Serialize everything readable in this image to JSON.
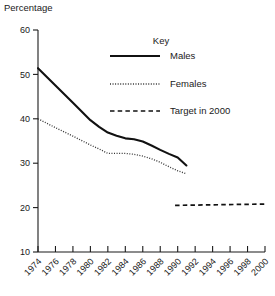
{
  "chart_data": {
    "type": "line",
    "title": "",
    "subtitle": "",
    "xlabel": "",
    "ylabel": "Percentage",
    "xlim": [
      1974,
      2000
    ],
    "ylim": [
      10,
      60
    ],
    "grid": false,
    "legend_position": "top-right",
    "legend_title": "Key",
    "x_ticks": [
      1974,
      1976,
      1978,
      1980,
      1982,
      1984,
      1986,
      1988,
      1990,
      1992,
      1994,
      1996,
      1998,
      2000
    ],
    "x_tick_labels": [
      "1974",
      "1976",
      "1978",
      "1980",
      "1982",
      "1984",
      "1986",
      "1988",
      "1990",
      "1992",
      "1994",
      "1996",
      "1998",
      "2000"
    ],
    "y_ticks": [
      10,
      20,
      30,
      40,
      50,
      60
    ],
    "y_tick_labels": [
      "10",
      "20",
      "30",
      "40",
      "50",
      "60"
    ],
    "series": [
      {
        "name": "Males",
        "style": "solid",
        "color": "#111111",
        "x": [
          1974,
          1976,
          1978,
          1980,
          1981,
          1982,
          1983,
          1984,
          1985,
          1986,
          1987,
          1988,
          1989,
          1990,
          1991
        ],
        "values": [
          51.4,
          47.5,
          43.6,
          39.7,
          38.2,
          36.9,
          36.2,
          35.6,
          35.4,
          34.9,
          34.0,
          33.0,
          32.1,
          31.3,
          29.5
        ]
      },
      {
        "name": "Females",
        "style": "dotted",
        "color": "#333333",
        "x": [
          1974,
          1976,
          1978,
          1980,
          1981,
          1982,
          1983,
          1984,
          1985,
          1986,
          1987,
          1988,
          1989,
          1990,
          1991
        ],
        "values": [
          40.0,
          38.0,
          36.1,
          34.1,
          33.2,
          32.2,
          32.2,
          32.2,
          32.0,
          31.6,
          31.0,
          30.2,
          29.2,
          28.3,
          27.6
        ]
      },
      {
        "name": "Target in 2000",
        "style": "dashed",
        "color": "#111111",
        "x": [
          1989.7,
          2000
        ],
        "values": [
          20.5,
          20.8
        ]
      }
    ]
  },
  "legend": {
    "title": "Key",
    "entries": [
      {
        "label": "Males",
        "style": "solid"
      },
      {
        "label": "Females",
        "style": "dotted"
      },
      {
        "label": "Target in 2000",
        "style": "dashed"
      }
    ]
  },
  "axes": {
    "y_axis_label": "Percentage"
  }
}
